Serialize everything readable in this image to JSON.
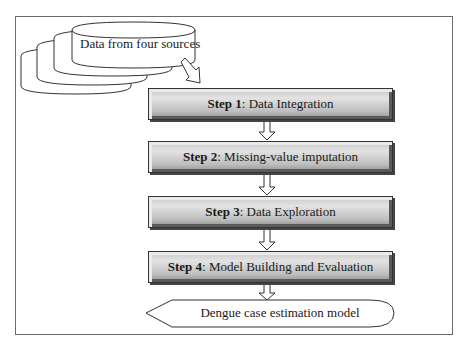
{
  "diagram": {
    "type": "flowchart",
    "source": {
      "label": "Data from four sources",
      "shape": "stacked-cylinders",
      "count": 4
    },
    "steps": [
      {
        "number_label": "Step 1",
        "title": ": Data Integration"
      },
      {
        "number_label": "Step 2",
        "title": ": Missing-value imputation"
      },
      {
        "number_label": "Step 3",
        "title": ": Data Exploration"
      },
      {
        "number_label": "Step 4",
        "title": ": Model Building and Evaluation"
      }
    ],
    "output": {
      "label": "Dengue case estimation model",
      "shape": "display"
    },
    "colors": {
      "frame": "#6a6a6a",
      "step_fill_light": "#e3e3e3",
      "step_fill_dark": "#8f8f8f",
      "stroke": "#333333"
    }
  }
}
